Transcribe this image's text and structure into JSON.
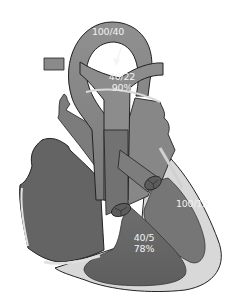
{
  "diagram": {
    "type": "heart-anatomy-hemodynamics",
    "colors": {
      "background": "#ffffff",
      "great_vessel": "#8a8a8a",
      "chamber_dark": "#6a6a6a",
      "chamber_mid": "#777777",
      "atrium_right": "#8c8c8c",
      "myocardium": "#d6d6d6",
      "outline": "#222222",
      "label_text": "#f2f2f2"
    },
    "labels": {
      "aorta": {
        "pressure": "100/40"
      },
      "pulmonary_artery": {
        "pressure": "40/22",
        "saturation": "90%"
      },
      "left_ventricle": {
        "pressure": "100/15"
      },
      "right_ventricle": {
        "pressure": "40/5",
        "saturation": "78%"
      }
    },
    "annotations": {
      "shunt_arrow": "arrow-down-left from aortic arch to pulmonary artery"
    }
  }
}
